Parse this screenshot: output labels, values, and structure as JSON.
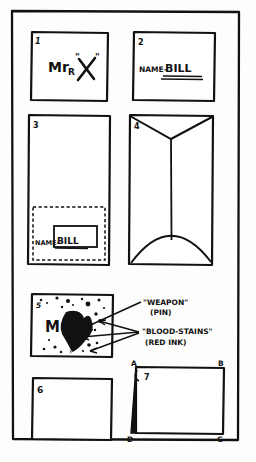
{
  "page": {
    "background_color": "#fdfdfb",
    "ink_color": "#111111",
    "panel_count": 7
  },
  "panels": [
    {
      "number": "1",
      "name": "panel-1-card-front",
      "text": "Mr",
      "subscript": "R",
      "mark": "X",
      "quote_open": "\"",
      "quote_close": "\""
    },
    {
      "number": "2",
      "name": "panel-2-name-line",
      "label": "NAME-",
      "value": "BILL"
    },
    {
      "number": "3",
      "name": "panel-3-folded-sheet",
      "label": "NAME-",
      "value": "BILL"
    },
    {
      "number": "4",
      "name": "panel-4-envelope-back"
    },
    {
      "number": "5",
      "name": "panel-5-stained-letter",
      "letter": "M"
    },
    {
      "number": "6",
      "name": "panel-6-blank-card"
    },
    {
      "number": "7",
      "name": "panel-7-square-abcd",
      "corners": [
        "A",
        "B",
        "C",
        "D"
      ]
    }
  ],
  "annotations": [
    {
      "name": "weapon-annotation",
      "title": "\"WEAPON\"",
      "detail": "(PIN)"
    },
    {
      "name": "blood-stains-annotation",
      "title": "\"BLOOD-STAINS\"",
      "detail": "(RED INK)"
    }
  ]
}
